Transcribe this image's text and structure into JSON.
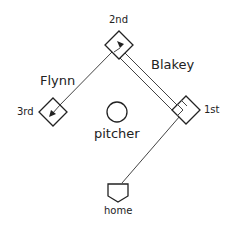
{
  "diagram": {
    "title": "",
    "bases": {
      "second": {
        "label": "2nd",
        "x": 119,
        "y": 45
      },
      "third": {
        "label": "3rd",
        "x": 53,
        "y": 112
      },
      "first": {
        "label": "1st",
        "x": 186,
        "y": 110
      },
      "home": {
        "label": "home",
        "x": 118,
        "y": 190
      }
    },
    "pitcher": {
      "label": "pitcher",
      "x": 117,
      "y": 112
    },
    "runners": [
      {
        "name": "Flynn",
        "from": "2nd",
        "to": "3rd",
        "path": "single-line"
      },
      {
        "name": "Blakey",
        "from": "1st",
        "to": "2nd",
        "path": "double-line"
      }
    ],
    "other_paths": [
      {
        "from": "home",
        "to": "1st",
        "path": "single-line"
      }
    ],
    "colors": {
      "stroke": "#222222",
      "background": "#ffffff"
    }
  }
}
